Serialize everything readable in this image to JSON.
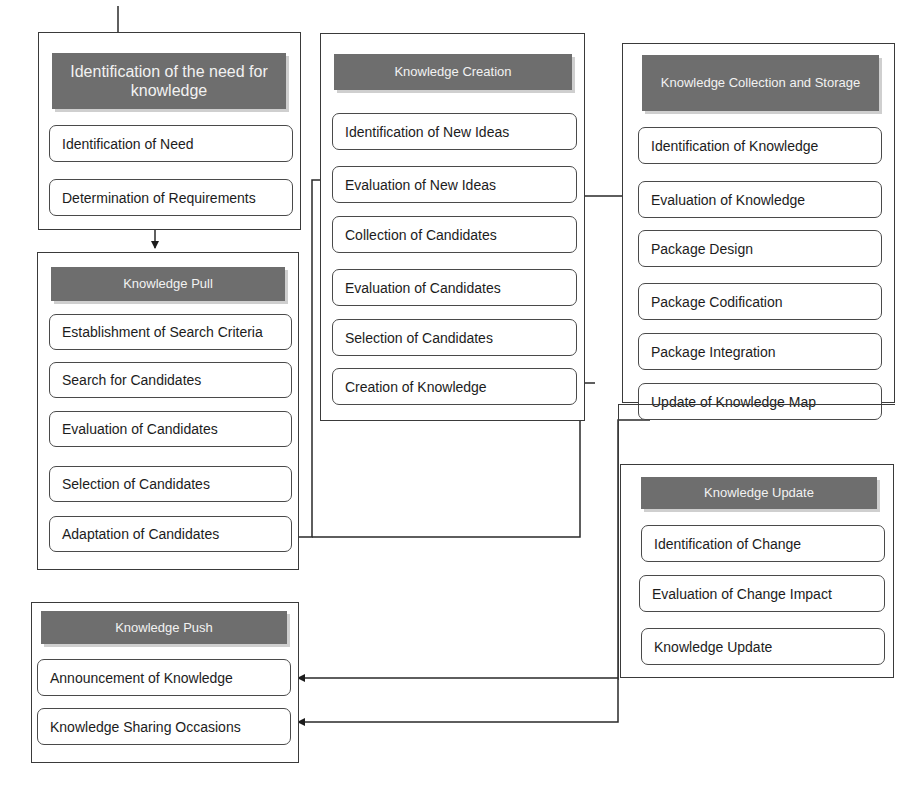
{
  "groups": {
    "need": {
      "title": "Identification of the need for knowledge",
      "steps": [
        "Identification of Need",
        "Determination of Requirements"
      ]
    },
    "pull": {
      "title": "Knowledge Pull",
      "steps": [
        "Establishment of Search Criteria",
        "Search for Candidates",
        "Evaluation of Candidates",
        "Selection of Candidates",
        "Adaptation of Candidates"
      ]
    },
    "creation": {
      "title": "Knowledge Creation",
      "steps": [
        "Identification of New Ideas",
        "Evaluation of New Ideas",
        "Collection of Candidates",
        "Evaluation of Candidates",
        "Selection of Candidates",
        "Creation of Knowledge"
      ]
    },
    "collection": {
      "title": "Knowledge Collection and Storage",
      "steps": [
        "Identification of Knowledge",
        "Evaluation of Knowledge",
        "Package Design",
        "Package Codification",
        "Package Integration",
        "Update of Knowledge Map"
      ]
    },
    "update": {
      "title": "Knowledge Update",
      "steps": [
        "Identification of Change",
        "Evaluation of Change Impact",
        "Knowledge Update"
      ]
    },
    "push": {
      "title": "Knowledge Push",
      "steps": [
        "Announcement of Knowledge",
        "Knowledge Sharing Occasions"
      ]
    }
  },
  "colors": {
    "header_bg": "#6e6e6e",
    "header_text": "#f2f2f2",
    "border": "#3a3a3a"
  }
}
